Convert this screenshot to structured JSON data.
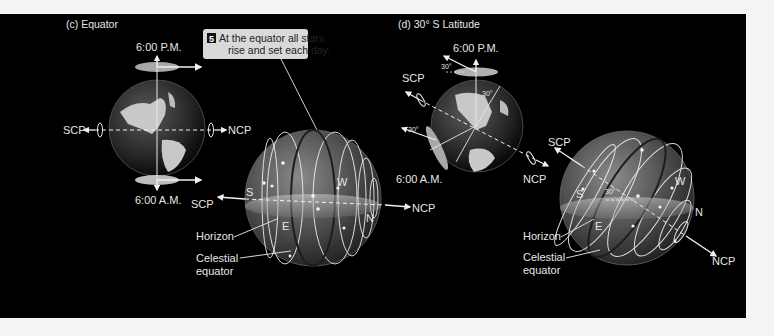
{
  "panels": [
    {
      "id": "c",
      "title": "(c)  Equator",
      "earth": {
        "top_time": "6:00 P.M.",
        "bottom_time": "6:00 A.M.",
        "left_pole": "SCP",
        "right_pole": "NCP"
      },
      "sky": {
        "left_pole": "SCP",
        "right_pole": "NCP",
        "directions": {
          "south": "S",
          "east": "E",
          "west": "W",
          "north": "N"
        },
        "horizon_label": "Horizon",
        "equator_label_line1": "Celestial",
        "equator_label_line2": "equator"
      },
      "callout": {
        "number": "5",
        "line1": "At the equator all stars",
        "line2": "rise and set each day."
      }
    },
    {
      "id": "d",
      "title": "(d)  30° S Latitude",
      "earth": {
        "top_time": "6:00 P.M.",
        "bottom_time": "6:00 A.M.",
        "upper_pole": "SCP",
        "lower_pole": "NCP",
        "angle_labels": [
          "30°",
          "30°",
          "30°"
        ]
      },
      "sky": {
        "upper_pole": "SCP",
        "lower_pole": "NCP",
        "directions": {
          "south": "S",
          "east": "E",
          "west": "W",
          "north": "N"
        },
        "angle_label": "30°",
        "horizon_label": "Horizon",
        "equator_label_line1": "Celestial",
        "equator_label_line2": "equator"
      }
    }
  ],
  "colors": {
    "background": "#000000",
    "page": "#f4f4f4",
    "callout_fill": "#d9d9d9",
    "label": "#e6e6e6"
  }
}
